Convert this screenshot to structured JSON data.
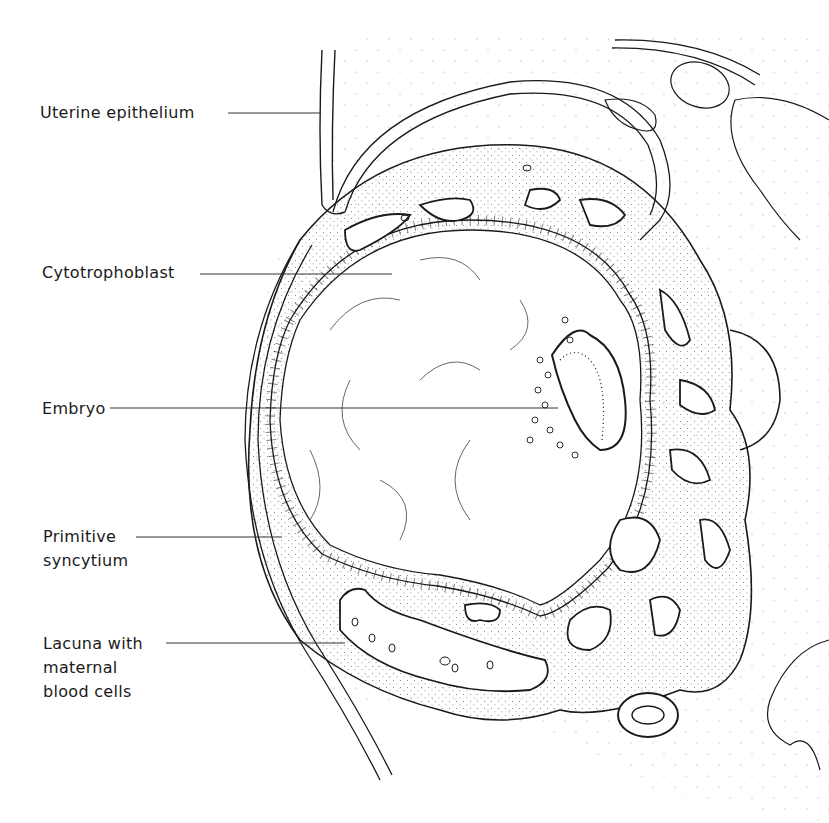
{
  "figure": {
    "colors": {
      "ink": "#1a1a1a",
      "background": "#ffffff",
      "stipple": "#8a8a8a"
    },
    "labels": [
      {
        "id": "uterine-epithelium",
        "text": "Uterine epithelium",
        "x": 40,
        "y": 101,
        "line_from": [
          228,
          113
        ],
        "line_to": [
          320,
          113
        ]
      },
      {
        "id": "cytotrophoblast",
        "text": "Cytotrophoblast",
        "x": 42,
        "y": 261,
        "line_from": [
          200,
          274
        ],
        "line_to": [
          392,
          274
        ]
      },
      {
        "id": "embryo",
        "text": "Embryo",
        "x": 42,
        "y": 397,
        "line_from": [
          110,
          408
        ],
        "line_to": [
          558,
          408
        ]
      },
      {
        "id": "primitive-syncytium",
        "text": "Primitive\nsyncytium",
        "x": 43,
        "y": 525,
        "line_from": [
          136,
          537
        ],
        "line_to": [
          282,
          537
        ]
      },
      {
        "id": "lacuna",
        "text": "Lacuna with\nmaternal\nblood cells",
        "x": 43,
        "y": 632,
        "line_from": [
          166,
          643
        ],
        "line_to": [
          345,
          643
        ]
      }
    ]
  }
}
